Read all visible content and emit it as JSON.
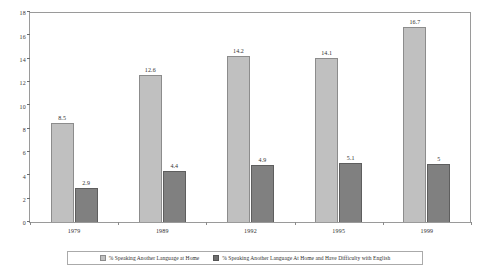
{
  "chart_data": {
    "type": "bar",
    "title": "",
    "xlabel": "",
    "ylabel": "",
    "categories": [
      "1979",
      "1989",
      "1992",
      "1995",
      "1999"
    ],
    "ylim": [
      0,
      18
    ],
    "yticks": [
      0,
      2,
      4,
      6,
      8,
      10,
      12,
      14,
      16,
      18
    ],
    "grid": false,
    "legend_position": "bottom",
    "series": [
      {
        "name": "% Speaking Another Language at Home",
        "color": "#c0c0c0",
        "values": [
          8.5,
          12.6,
          14.2,
          14.1,
          16.7
        ],
        "labels": [
          "8.5",
          "12.6",
          "14.2",
          "14.1",
          "16.7"
        ]
      },
      {
        "name": "% Speaking Another Language At Home and Have Difficulty with English",
        "color": "#808080",
        "values": [
          2.9,
          4.4,
          4.9,
          5.1,
          5
        ],
        "labels": [
          "2.9",
          "4.4",
          "4.9",
          "5.1",
          "5"
        ]
      }
    ]
  },
  "legend": {
    "items": [
      {
        "label": "% Speaking Another Language at Home",
        "swatch": "light"
      },
      {
        "label": "% Speaking Another Language At Home and Have Difficulty with English",
        "swatch": "dark"
      }
    ]
  }
}
